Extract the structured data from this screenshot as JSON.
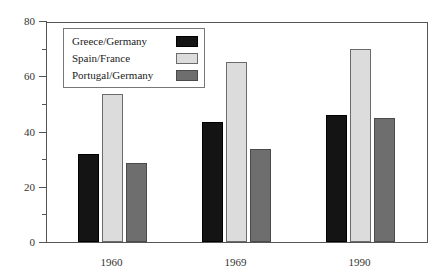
{
  "chart_data": {
    "type": "bar",
    "title": "",
    "subtitle": "",
    "xlabel": "",
    "ylabel": "",
    "categories": [
      "1960",
      "1969",
      "1990"
    ],
    "series": [
      {
        "name": "Greece/Germany",
        "color": "#141414",
        "values": [
          32,
          43.5,
          46
        ]
      },
      {
        "name": "Spain/France",
        "color": "#dcdcdc",
        "values": [
          53.5,
          65,
          70
        ]
      },
      {
        "name": "Portugal/Germany",
        "color": "#6e6e6e",
        "values": [
          28.5,
          33.5,
          45
        ]
      }
    ],
    "ylim": [
      0,
      80
    ],
    "y_ticks_major": [
      0,
      20,
      40,
      60,
      80
    ],
    "y_ticks_minor": [
      10,
      30,
      50,
      70
    ],
    "y_tick_labels": [
      "0",
      "20",
      "40",
      "60",
      "80"
    ],
    "grid": false,
    "legend_position": "top-left",
    "frame": true
  }
}
